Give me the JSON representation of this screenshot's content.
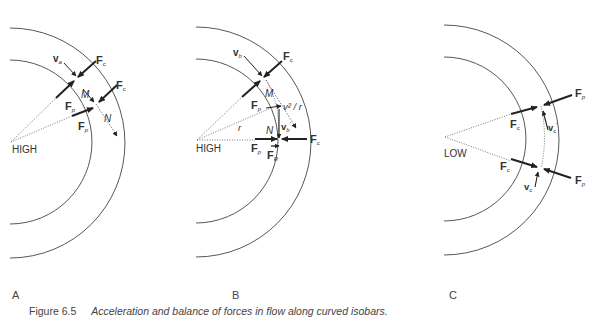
{
  "panels": [
    {
      "letter": "A",
      "center_label": "HIGH",
      "labels": {
        "va": "v",
        "va_sub": "a",
        "fc1": "F",
        "fc1_sub": "c",
        "fc2": "F",
        "fc2_sub": "c",
        "fp1": "F",
        "fp1_sub": "p",
        "fp2": "F",
        "fp2_sub": "p",
        "m": "M",
        "n": "N"
      }
    },
    {
      "letter": "B",
      "center_label": "HIGH",
      "labels": {
        "vb": "v",
        "vb_sub": "b",
        "fc1": "F",
        "fc1_sub": "c",
        "fc2": "F",
        "fc2_sub": "c",
        "fp1": "F",
        "fp1_sub": "p",
        "fp2": "F",
        "fp2_sub": "p",
        "m": "M",
        "n": "N",
        "accel": "v² / r",
        "r": "r",
        "vb2": "v",
        "vb2_sub": "b",
        "vb2_prime": "′",
        "fr": "F",
        "fr_sub": "R"
      }
    },
    {
      "letter": "C",
      "center_label": "LOW",
      "labels": {
        "fp1": "F",
        "fp1_sub": "p",
        "fp2": "F",
        "fp2_sub": "p",
        "fc1": "F",
        "fc1_sub": "c",
        "fc2": "F",
        "fc2_sub": "c",
        "vc1": "v",
        "vc1_sub": "c",
        "vc1_prime": "′",
        "vc2": "v",
        "vc2_sub": "c"
      }
    }
  ],
  "caption": {
    "figure_number": "Figure 6.5",
    "text": "Acceleration and balance of forces in flow along curved isobars."
  }
}
